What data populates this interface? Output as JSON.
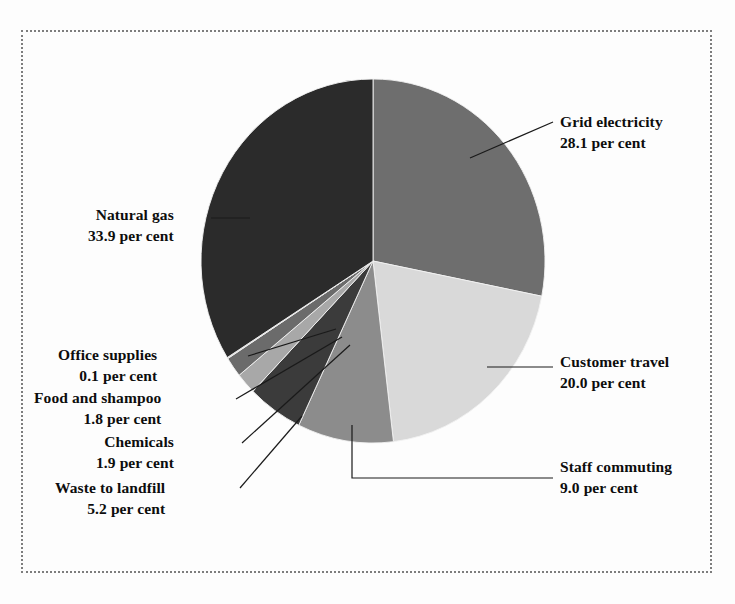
{
  "figure": {
    "background_color": "#fdfdfd",
    "frame_style": "dotted",
    "frame_color": "#7d7d7d"
  },
  "chart_data": {
    "type": "pie",
    "title": "",
    "subtitle": "",
    "xlabel": "",
    "ylabel": "",
    "legend_position": "callout-labels",
    "grid": false,
    "units": "per cent",
    "start_angle_deg": 0,
    "direction": "clockwise",
    "categories": [
      "Grid electricity",
      "Customer travel",
      "Staff commuting",
      "Waste to landfill",
      "Chemicals",
      "Food and shampoo",
      "Office supplies",
      "Natural gas"
    ],
    "values": [
      28.1,
      20.0,
      9.0,
      5.2,
      1.9,
      1.8,
      0.1,
      33.9
    ],
    "colors": [
      "#6e6e6e",
      "#d9d9d9",
      "#8c8c8c",
      "#3b3b3b",
      "#a8a8a8",
      "#6b6b6b",
      "#cfcfcf",
      "#2b2b2b"
    ],
    "slices": [
      {
        "label": "Grid electricity",
        "value": 28.1,
        "value_text": "28.1",
        "unit_text": "per cent",
        "color": "#6e6e6e"
      },
      {
        "label": "Customer travel",
        "value": 20.0,
        "value_text": "20.0",
        "unit_text": "per cent",
        "color": "#d9d9d9"
      },
      {
        "label": "Staff commuting",
        "value": 9.0,
        "value_text": "9.0",
        "unit_text": "per cent",
        "color": "#8c8c8c"
      },
      {
        "label": "Waste to landfill",
        "value": 5.2,
        "value_text": "5.2",
        "unit_text": "per cent",
        "color": "#3b3b3b"
      },
      {
        "label": "Chemicals",
        "value": 1.9,
        "value_text": "1.9",
        "unit_text": "per cent",
        "color": "#a8a8a8"
      },
      {
        "label": "Food and shampoo",
        "value": 1.8,
        "value_text": "1.8",
        "unit_text": "per cent",
        "color": "#6b6b6b"
      },
      {
        "label": "Office supplies",
        "value": 0.1,
        "value_text": "0.1",
        "unit_text": "per cent",
        "color": "#cfcfcf"
      },
      {
        "label": "Natural gas",
        "value": 33.9,
        "value_text": "33.9",
        "unit_text": "per cent",
        "color": "#2b2b2b"
      }
    ]
  },
  "labels": {
    "grid_electricity": {
      "line1": "Grid electricity",
      "line2": "28.1 per cent"
    },
    "customer_travel": {
      "line1": "Customer travel",
      "line2": "20.0 per cent"
    },
    "staff_commuting": {
      "line1": "Staff commuting",
      "line2": "9.0 per cent"
    },
    "natural_gas": {
      "line1": "Natural gas",
      "line2": "33.9 per cent"
    },
    "office_supplies": {
      "line1": "Office supplies",
      "line2": "0.1 per cent"
    },
    "food_and_shampoo": {
      "line1": "Food and shampoo",
      "line2": "1.8 per cent"
    },
    "chemicals": {
      "line1": "Chemicals",
      "line2": "1.9 per cent"
    },
    "waste_to_landfill": {
      "line1": "Waste to landfill",
      "line2": "5.2 per cent"
    }
  }
}
